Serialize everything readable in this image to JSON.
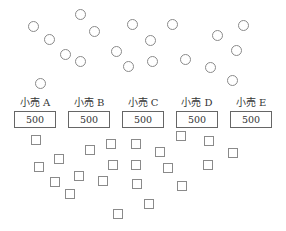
{
  "diagram": {
    "circles": [
      [
        33,
        26
      ],
      [
        49,
        39
      ],
      [
        65,
        54
      ],
      [
        80,
        61
      ],
      [
        80,
        14
      ],
      [
        94,
        31
      ],
      [
        132,
        24
      ],
      [
        116,
        51
      ],
      [
        128,
        66
      ],
      [
        40,
        83
      ],
      [
        172,
        24
      ],
      [
        150,
        40
      ],
      [
        152,
        61
      ],
      [
        185,
        59
      ],
      [
        217,
        35
      ],
      [
        243,
        25
      ],
      [
        236,
        50
      ],
      [
        210,
        67
      ],
      [
        232,
        80
      ]
    ],
    "stores": [
      {
        "label": "小売 A",
        "value": "500",
        "x": 14
      },
      {
        "label": "小売 B",
        "value": "500",
        "x": 68
      },
      {
        "label": "小売 C",
        "value": "500",
        "x": 122
      },
      {
        "label": "小売 D",
        "value": "500",
        "x": 176
      },
      {
        "label": "小売 E",
        "value": "500",
        "x": 230
      }
    ],
    "squares": [
      [
        36,
        140
      ],
      [
        59,
        159
      ],
      [
        39,
        167
      ],
      [
        90,
        150
      ],
      [
        111,
        144
      ],
      [
        136,
        144
      ],
      [
        79,
        176
      ],
      [
        55,
        182
      ],
      [
        70,
        194
      ],
      [
        103,
        181
      ],
      [
        113,
        165
      ],
      [
        136,
        165
      ],
      [
        137,
        184
      ],
      [
        118,
        214
      ],
      [
        149,
        204
      ],
      [
        181,
        136
      ],
      [
        160,
        152
      ],
      [
        168,
        168
      ],
      [
        209,
        141
      ],
      [
        182,
        186
      ],
      [
        233,
        153
      ],
      [
        208,
        165
      ]
    ]
  }
}
